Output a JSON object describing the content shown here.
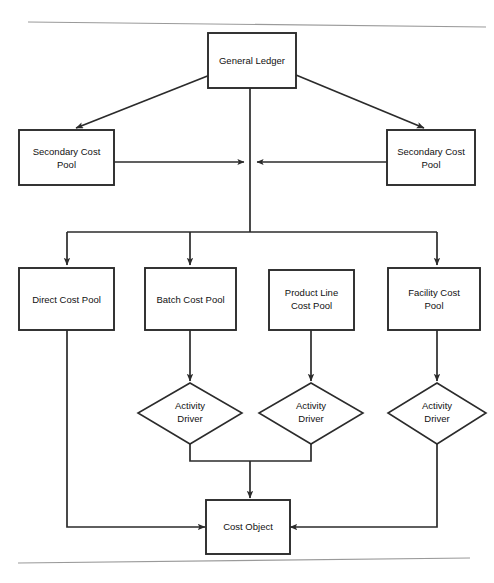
{
  "diagram": {
    "background_color": "#ffffff",
    "line_color": "#2b2b2b",
    "text_color": "#111111",
    "nodes": {
      "general_ledger": {
        "label": "General Ledger",
        "shape": "rectangle"
      },
      "secondary_cost_pool_left": {
        "label_line1": "Secondary Cost",
        "label_line2": "Pool",
        "shape": "rectangle"
      },
      "secondary_cost_pool_right": {
        "label_line1": "Secondary Cost",
        "label_line2": "Pool",
        "shape": "rectangle"
      },
      "direct_cost_pool": {
        "label": "Direct Cost Pool",
        "shape": "rectangle"
      },
      "batch_cost_pool": {
        "label": "Batch Cost Pool",
        "shape": "rectangle"
      },
      "product_line_cost_pool": {
        "label_line1": "Product Line",
        "label_line2": "Cost Pool",
        "shape": "rectangle"
      },
      "facility_cost_pool": {
        "label_line1": "Facility Cost",
        "label_line2": "Pool",
        "shape": "rectangle"
      },
      "activity_driver_batch": {
        "label_line1": "Activity",
        "label_line2": "Driver",
        "shape": "diamond"
      },
      "activity_driver_product_line": {
        "label_line1": "Activity",
        "label_line2": "Driver",
        "shape": "diamond"
      },
      "activity_driver_facility": {
        "label_line1": "Activity",
        "label_line2": "Driver",
        "shape": "diamond"
      },
      "cost_object": {
        "label": "Cost Object",
        "shape": "rectangle"
      }
    }
  }
}
